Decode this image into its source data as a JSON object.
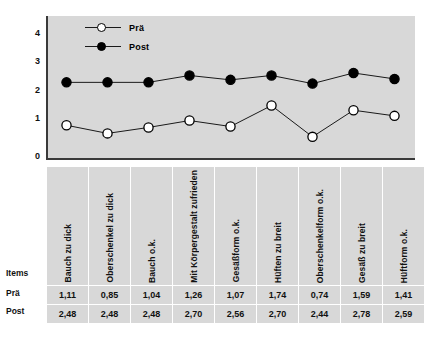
{
  "chart_data": {
    "type": "line",
    "title": "",
    "xlabel": "",
    "ylabel": "",
    "ylim": [
      0,
      4.6
    ],
    "yticks": [
      "0",
      "1",
      "2",
      "3",
      "4"
    ],
    "grid": false,
    "legend_position": "top-left",
    "categories": [
      "Bauch zu dick",
      "Oberschenkel zu dick",
      "Bauch o.k.",
      "Mit Körpergestalt zufrieden",
      "Gesäßform o.k.",
      "Hüften zu breit",
      "Oberschenkelform o.k.",
      "Gesäß zu breit",
      "Hüftform o.k."
    ],
    "series": [
      {
        "name": "Prä",
        "marker": "open-circle",
        "values": [
          1.11,
          0.85,
          1.04,
          1.26,
          1.07,
          1.74,
          0.74,
          1.59,
          1.41
        ],
        "labels": [
          "1,11",
          "0,85",
          "1,04",
          "1,26",
          "1,07",
          "1,74",
          "0,74",
          "1,59",
          "1,41"
        ]
      },
      {
        "name": "Post",
        "marker": "filled-circle",
        "values": [
          2.48,
          2.48,
          2.48,
          2.7,
          2.56,
          2.7,
          2.44,
          2.78,
          2.59
        ],
        "labels": [
          "2,48",
          "2,48",
          "2,48",
          "2,70",
          "2,56",
          "2,70",
          "2,44",
          "2,78",
          "2,59"
        ]
      }
    ]
  },
  "legend": {
    "entries": [
      {
        "label": "Prä",
        "marker": "open-circle"
      },
      {
        "label": "Post",
        "marker": "filled-circle"
      }
    ]
  },
  "axis": {
    "y_ticks": [
      "4",
      "3",
      "2",
      "1",
      "0"
    ]
  },
  "table": {
    "row_labels": {
      "items": "Items",
      "pra": "Prä",
      "post": "Post"
    },
    "headers": [
      "Bauch zu dick",
      "Oberschenkel zu dick",
      "Bauch o.k.",
      "Mit Körpergestalt zufrieden",
      "Gesäßform o.k.",
      "Hüften zu breit",
      "Oberschenkelform o.k.",
      "Gesäß zu breit",
      "Hüftform o.k."
    ],
    "pra_values": [
      "1,11",
      "0,85",
      "1,04",
      "1,26",
      "1,07",
      "1,74",
      "0,74",
      "1,59",
      "1,41"
    ],
    "post_values": [
      "2,48",
      "2,48",
      "2,48",
      "2,70",
      "2,56",
      "2,70",
      "2,44",
      "2,78",
      "2,59"
    ]
  },
  "colors": {
    "panel_bg": "#d8d8d8",
    "axis": "#3a3a3a",
    "line": "#1a1a1a",
    "marker_open": "#ffffff",
    "marker_filled": "#000000",
    "page_bg": "#ffffff"
  }
}
